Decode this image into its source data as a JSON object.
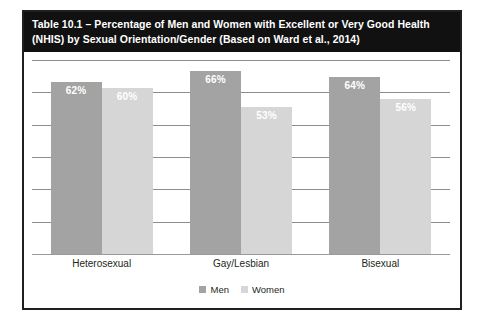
{
  "figure": {
    "title_line1": "Table 10.1 – Percentage of Men and Women with Excellent or Very Good Health",
    "title_line2": "(NHIS) by Sexual Orientation/Gender (Based on Ward et al., 2014)",
    "border_color": "#231f20",
    "header_background": "#111111",
    "header_text_color": "#ffffff"
  },
  "chart_data": {
    "type": "bar",
    "title": "Table 10.1 – Percentage of Men and Women with Excellent or Very Good Health (NHIS) by Sexual Orientation/Gender (Based on Ward et al., 2014)",
    "xlabel": "",
    "ylabel": "",
    "ylim": [
      0,
      70
    ],
    "ytick_step": 10,
    "yticks_visible": false,
    "grid": true,
    "gridlines": 7,
    "legend_position": "bottom-center",
    "categories": [
      "Heterosexual",
      "Gay/Lesbian",
      "Bisexual"
    ],
    "series": [
      {
        "name": "Men",
        "color": "#a3a3a3",
        "values": [
          62,
          66,
          64
        ],
        "labels": [
          "62%",
          "66%",
          "64%"
        ]
      },
      {
        "name": "Women",
        "color": "#d6d6d6",
        "values": [
          60,
          53,
          56
        ],
        "labels": [
          "60%",
          "53%",
          "56%"
        ]
      }
    ]
  }
}
